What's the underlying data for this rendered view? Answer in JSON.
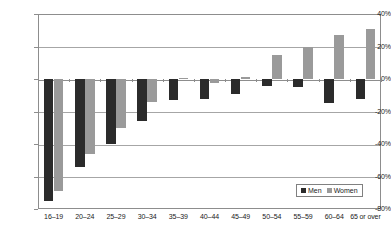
{
  "chart_data": {
    "type": "bar",
    "title": "",
    "subtitle": "",
    "xlabel": "",
    "ylabel": "",
    "orientation": "vertical",
    "grouping": "grouped",
    "ylim": [
      -80,
      40
    ],
    "ytick_values": [
      40,
      20,
      0,
      -20,
      -40,
      -60,
      -80
    ],
    "ytick_labels": [
      "40%",
      "20%",
      "0%",
      "-20%",
      "-40%",
      "-60%",
      "-80%"
    ],
    "grid": "horizontal",
    "legend_position": "inside-bottom-right",
    "categories": [
      "16–19",
      "20–24",
      "25–29",
      "30–34",
      "35–39",
      "40–44",
      "45–49",
      "50–54",
      "55–59",
      "60–64",
      "65 or over"
    ],
    "series": [
      {
        "name": "Men",
        "color": "#2b2b2b",
        "values": [
          -75,
          -54,
          -40,
          -26,
          -13,
          -12,
          -9,
          -4,
          -5,
          -15,
          -12
        ]
      },
      {
        "name": "Women",
        "color": "#9a9a9a",
        "values": [
          -69,
          -46,
          -30,
          -14,
          0.5,
          -2.5,
          1.5,
          15,
          20,
          27,
          31
        ]
      }
    ]
  },
  "legend": {
    "items": [
      {
        "label": "Men",
        "swatch": "men"
      },
      {
        "label": "Women",
        "swatch": "women"
      }
    ]
  },
  "colors": {
    "men": "#2b2b2b",
    "women": "#9a9a9a",
    "gridline": "#a6a6a6",
    "axis": "#8d8d8d",
    "text": "#1a1a1a",
    "background": "#ffffff"
  }
}
